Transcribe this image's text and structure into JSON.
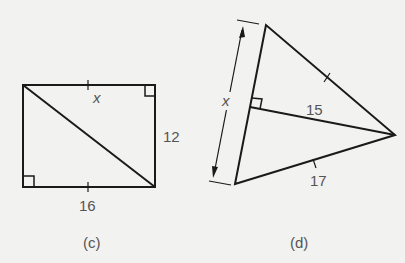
{
  "figure_c": {
    "caption": "(c)",
    "shape": "rectangle with diagonal",
    "labels": {
      "diagonal": "x",
      "right_side": "12",
      "bottom_side": "16"
    },
    "marks": [
      "right-angle top-right",
      "right-angle bottom-left",
      "tick top side",
      "tick bottom side"
    ]
  },
  "figure_d": {
    "caption": "(d)",
    "shape": "triangle with altitude",
    "labels": {
      "left_side": "x",
      "altitude": "15",
      "lower_side": "17"
    },
    "marks": [
      "right-angle at altitude foot",
      "tick upper-right side",
      "tick lower side",
      "dimension arrow along left side"
    ]
  },
  "colors": {
    "stroke": "#1a1a1a",
    "label": "#555555",
    "background": "#f2f2f1"
  }
}
